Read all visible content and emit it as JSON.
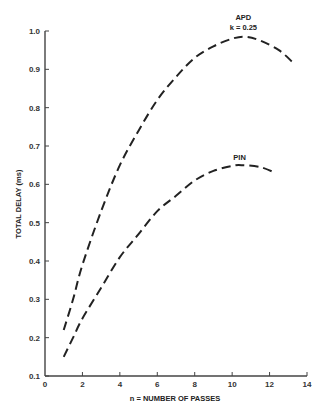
{
  "chart_data": {
    "type": "line",
    "title": "",
    "xlabel": "n = NUMBER OF PASSES",
    "ylabel": "TOTAL DELAY (ms)",
    "xlim": [
      0,
      14
    ],
    "ylim": [
      0.1,
      1.0
    ],
    "xticks": [
      "0",
      "2",
      "4",
      "6",
      "8",
      "10",
      "12",
      "14"
    ],
    "yticks": [
      "0.1",
      "0.2",
      "0.3",
      "0.4",
      "0.5",
      "0.6",
      "0.7",
      "0.8",
      "0.9",
      "1.0"
    ],
    "grid": false,
    "line_style": "dashed",
    "series": [
      {
        "name": "APD k = 0.25",
        "label_line1": "APD",
        "label_line2": "k = 0.25",
        "x": [
          1,
          1.5,
          2,
          3,
          4,
          5,
          6,
          7,
          8,
          9,
          10,
          10.7,
          11.5,
          12.5,
          13.2
        ],
        "y": [
          0.22,
          0.3,
          0.39,
          0.53,
          0.65,
          0.74,
          0.82,
          0.88,
          0.93,
          0.96,
          0.98,
          0.985,
          0.975,
          0.95,
          0.92
        ]
      },
      {
        "name": "PIN",
        "label_line1": "PIN",
        "x": [
          1,
          1.5,
          2,
          3,
          4,
          5,
          6,
          7,
          8,
          9,
          10,
          10.5,
          11.5,
          12.3
        ],
        "y": [
          0.15,
          0.2,
          0.25,
          0.33,
          0.41,
          0.47,
          0.53,
          0.57,
          0.61,
          0.635,
          0.648,
          0.65,
          0.645,
          0.63
        ]
      }
    ]
  }
}
